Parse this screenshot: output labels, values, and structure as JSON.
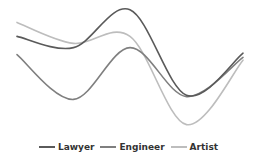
{
  "chart_data": {
    "type": "line",
    "title": "",
    "xlabel": "",
    "ylabel": "",
    "x": [
      1,
      2,
      3,
      4,
      5
    ],
    "ylim": [
      0,
      100
    ],
    "grid": false,
    "axes_visible": false,
    "legend_position": "bottom",
    "smooth": true,
    "series": [
      {
        "name": "Lawyer",
        "color": "#5a5a5a",
        "values": [
          74,
          66,
          93,
          32,
          62
        ]
      },
      {
        "name": "Engineer",
        "color": "#7f7f7f",
        "values": [
          61,
          29,
          66,
          31,
          59
        ]
      },
      {
        "name": "Artist",
        "color": "#bdbdbd",
        "values": [
          84,
          69,
          74,
          11,
          57
        ]
      }
    ]
  },
  "legend": {
    "items": [
      {
        "label": "Lawyer",
        "color": "#5a5a5a"
      },
      {
        "label": "Engineer",
        "color": "#7f7f7f"
      },
      {
        "label": "Artist",
        "color": "#bdbdbd"
      }
    ]
  }
}
